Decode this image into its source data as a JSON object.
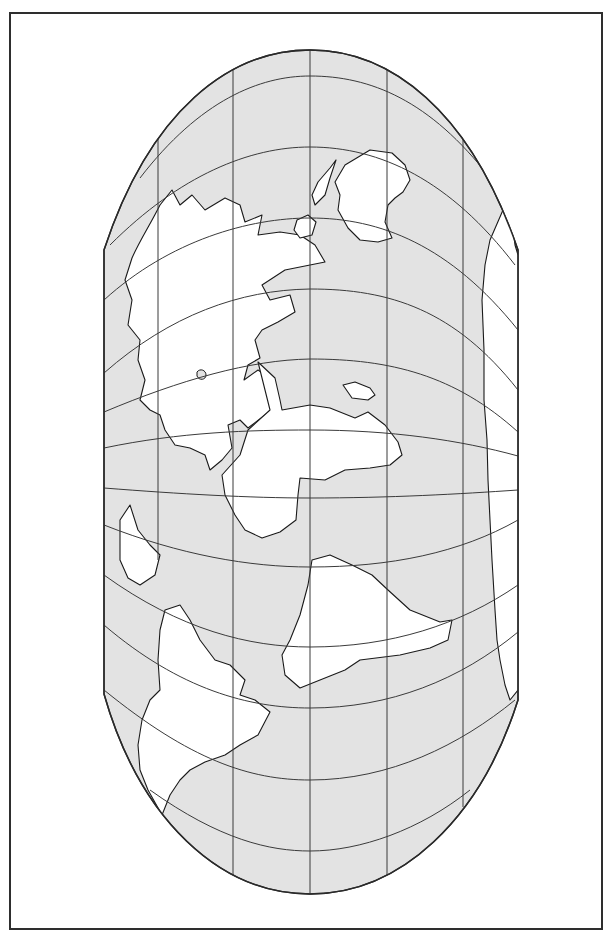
{
  "map": {
    "title": "",
    "colors": {
      "ocean": "#e3e3e3",
      "land": "#ffffff",
      "lines": "#2a2a2a",
      "frame": "#2e2e2e",
      "background": "#ffffff"
    },
    "frame": {
      "x": 9,
      "y": 12,
      "width": 594,
      "height": 918
    },
    "outline_path": "M104,250 C150,110 230,50 310,50 C390,50 470,110 518,250 L518,700 C480,820 400,894 310,894 C220,894 140,820 104,694 Z",
    "meridians": [
      {
        "name": "meridian-1",
        "path": "M158,137 L158,560"
      },
      {
        "name": "meridian-2",
        "path": "M233,68 L233,877"
      },
      {
        "name": "meridian-3",
        "path": "M310,50 L310,894"
      },
      {
        "name": "meridian-4",
        "path": "M387,68 L387,877"
      },
      {
        "name": "meridian-5",
        "path": "M463,137 L463,807"
      }
    ],
    "parallels": [
      {
        "name": "parallel-1",
        "path": "M140,178 C200,100 260,76 310,76 C370,76 430,100 490,178"
      },
      {
        "name": "parallel-2",
        "path": "M110,245 C180,175 250,147 310,147 C380,147 450,180 515,265"
      },
      {
        "name": "parallel-3",
        "path": "M104,300 C170,240 250,218 310,218 C380,218 450,245 518,330"
      },
      {
        "name": "parallel-4",
        "path": "M104,373 C170,315 240,290 310,289 C390,289 455,310 518,390"
      },
      {
        "name": "parallel-5",
        "path": "M104,412 C180,380 250,360 310,359 C390,359 455,375 518,432"
      },
      {
        "name": "parallel-6",
        "path": "M104,448 C180,432 250,430 310,430 C390,430 460,440 518,456"
      },
      {
        "name": "parallel-7",
        "path": "M104,488 C180,494 250,498 310,498 C390,498 460,494 518,490"
      },
      {
        "name": "parallel-8",
        "path": "M104,525 C180,555 250,567 310,567 C390,567 460,553 518,520"
      },
      {
        "name": "parallel-9",
        "path": "M104,575 C180,630 250,647 310,647 C390,647 460,625 518,585"
      },
      {
        "name": "parallel-10",
        "path": "M104,625 C180,690 250,708 310,708 C390,708 460,680 518,632"
      },
      {
        "name": "parallel-11",
        "path": "M104,690 C190,760 250,780 310,780 C390,780 460,745 515,700"
      },
      {
        "name": "parallel-12",
        "path": "M150,790 C220,840 270,851 310,851 C360,851 420,830 470,790"
      }
    ],
    "landmasses": [
      {
        "name": "northwest-continent",
        "path": "M132,258 C140,240 150,225 160,205 L172,190 L180,205 L192,195 L205,210 L225,198 L240,205 L245,222 L262,215 L258,235 L280,232 L300,235 L315,245 L325,262 L285,270 L262,285 L270,300 L290,295 L295,312 L278,322 L262,330 L255,340 L260,358 L248,365 L244,380 L258,370 L270,378 L270,395 L278,405 L248,428 L240,420 L228,425 L232,448 L222,460 L210,470 L205,455 L190,448 L175,445 L165,430 L160,415 L150,410 L140,400 L145,380 L138,360 L140,340 L128,325 L132,300 L125,280 Z"
      },
      {
        "name": "west-island-chain",
        "path": "M120,520 L130,505 L138,530 L150,545 L160,555 L155,575 L140,585 L128,578 L120,560 Z"
      },
      {
        "name": "great-island",
        "path": "M345,165 L370,150 L392,153 L405,165 L410,180 L403,192 L395,198 L388,205 L385,222 L392,238 L378,242 L360,240 L348,228 L338,210 L340,195 L335,182 Z"
      },
      {
        "name": "peninsula-north",
        "path": "M318,182 L330,168 L336,160 L330,178 L325,195 L315,205 L312,195 Z"
      },
      {
        "name": "small-island-north",
        "path": "M297,220 L308,215 L316,222 L312,235 L300,238 L294,230 Z"
      },
      {
        "name": "central-continent",
        "path": "M258,362 L275,378 L280,400 L282,410 L310,405 L330,408 L355,418 L368,412 L385,425 L398,442 L402,455 L390,465 L370,468 L345,470 L325,480 L300,478 L298,495 L296,520 L280,532 L262,538 L245,530 L235,515 L225,495 L222,475 L240,455 L248,430 L270,410 Z"
      },
      {
        "name": "east-lake-island",
        "path": "M343,385 L355,382 L370,388 L375,395 L368,400 L352,398 Z"
      },
      {
        "name": "south-central-continent",
        "path": "M312,560 L330,555 L352,565 L372,575 L388,590 L410,610 L440,622 L452,620 L448,640 L430,648 L400,655 L360,660 L345,670 L320,680 L300,688 L285,675 L282,655 L290,640 L300,615 L308,585 Z"
      },
      {
        "name": "southwest-continent",
        "path": "M165,610 L180,605 L190,620 L200,640 L215,660 L230,665 L245,680 L240,695 L255,700 L270,712 L258,735 L240,745 L225,755 L205,762 L190,770 L180,780 L170,795 L162,815 L148,790 L140,770 L138,745 L142,720 L150,700 L160,690 L158,660 L160,630 Z"
      },
      {
        "name": "east-coast-strip",
        "path": "M503,210 L510,205 L515,245 L518,255 L518,690 L510,700 L505,685 L500,660 L497,640 L495,610 L492,560 L490,520 L488,480 L487,440 L484,400 L484,350 L482,300 L485,265 L490,240 Z"
      },
      {
        "name": "east-small-peninsula",
        "path": "M480,125 L492,135 L500,150 L510,160 L506,170 L498,165 L492,152 L485,140 Z"
      }
    ],
    "lakes": [
      {
        "name": "inland-lake-1",
        "path": "M197,372 C200,368 206,370 206,375 C206,380 199,381 197,376 Z"
      }
    ]
  }
}
